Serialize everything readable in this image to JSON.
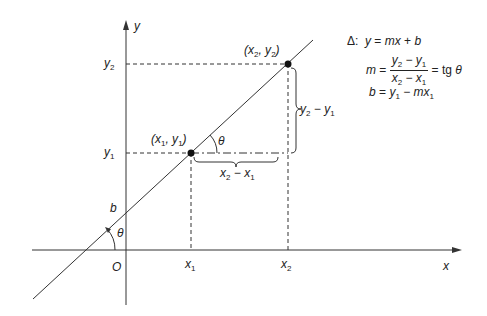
{
  "diagram": {
    "axes": {
      "x_label": "x",
      "y_label": "y",
      "origin_label": "O"
    },
    "points": [
      {
        "label": "(x1, y1)",
        "x_tick": "x1",
        "y_tick": "y1"
      },
      {
        "label": "(x2, y2)",
        "x_tick": "x2",
        "y_tick": "y2"
      }
    ],
    "annotations": {
      "intercept": "b",
      "angle_at_axis": "θ",
      "angle_at_point": "θ",
      "run": "x2 − x1",
      "rise": "y2 − y1"
    },
    "equations": {
      "symbol": "Δ:",
      "line": "y = mx + b",
      "slope_lhs": "m =",
      "slope_num": "y2 − y1",
      "slope_den": "x2 − x1",
      "slope_rhs": "= tg θ",
      "intercept": "b = y1 − mx1"
    }
  }
}
